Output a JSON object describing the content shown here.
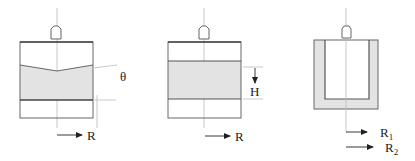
{
  "colors": {
    "outline": "#555555",
    "fill": "#e3e3e3",
    "axis": "#bbbbbb",
    "text": "#222222"
  },
  "figures": [
    {
      "id": "cone-plate",
      "labels": {
        "angle": "θ",
        "radius": "R"
      }
    },
    {
      "id": "parallel-plate",
      "labels": {
        "gap": "H",
        "radius": "R"
      }
    },
    {
      "id": "couette",
      "labels": {
        "inner_radius": "R",
        "inner_sub": "1",
        "outer_radius": "R",
        "outer_sub": "2"
      }
    }
  ]
}
